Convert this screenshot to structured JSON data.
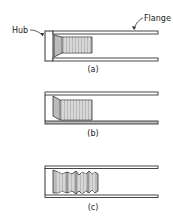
{
  "diagram": {
    "labels": {
      "hub": "Hub",
      "flange": "Flange"
    },
    "panels": [
      {
        "id": "a",
        "caption": "(a)",
        "state": "uniform bellows fully seated"
      },
      {
        "id": "b",
        "caption": "(b)",
        "state": "tapered bellows"
      },
      {
        "id": "c",
        "caption": "(c)",
        "state": "buckled wavy bellows"
      }
    ],
    "colors": {
      "line": "#333333",
      "fill": "#bbbbbb",
      "background": "#ffffff"
    }
  }
}
